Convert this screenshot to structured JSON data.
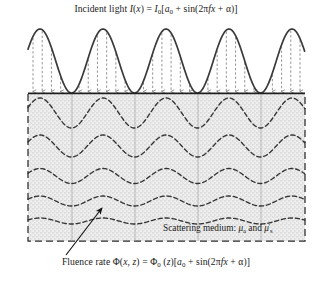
{
  "figure": {
    "title": "Incident light I(x) = I0[a0 + sin(2πfx + α)]",
    "caption": "Fluence rate Φ(x, z) = Φ0 (z)[a0 + sin(2πfx + α)]",
    "medium_label": "Scattering medium: μa and μ's",
    "title_parts": {
      "lead": "Incident light ",
      "i_var": "I",
      "open_x": "(",
      "x_var": "x",
      "close_x": ")",
      "equals": " = ",
      "i0_var": "I",
      "i0_sub": "0",
      "bracket_open": "[",
      "a_var": "a",
      "a_sub": "0",
      "plus": " + sin(2",
      "pi": "π",
      "f_var": "f",
      "x2_var": "x",
      "plus2": " + ",
      "alpha": "α",
      "tail": ")]"
    },
    "caption_parts": {
      "lead": "Fluence rate ",
      "phi": "Φ",
      "open": "(",
      "x_var": "x",
      "comma": ", ",
      "z_var": "z",
      "close": ")",
      "equals": " = ",
      "phi0": "Φ",
      "phi0_sub": "0",
      "z_paren": " (",
      "z_var2": "z",
      "z_close": ")",
      "bracket_open": "[",
      "a_var": "a",
      "a_sub": "0",
      "plus": " + sin(2",
      "pi": "π",
      "f_var": "f",
      "x2_var": "x",
      "plus2": " + ",
      "alpha": "α",
      "tail": ")]"
    },
    "medium_parts": {
      "lead": "Scattering medium: ",
      "mu_a": "μ",
      "mu_a_sub": "a",
      "and": " and ",
      "mu_s": "μ",
      "mu_s_prime": "'",
      "mu_s_sub": "s"
    },
    "colors": {
      "wave_stroke": "#3a3a3a",
      "arrow_stroke": "#8a8a8a",
      "box_border": "#2b2b2b",
      "box_fill": "#ededed",
      "contour_stroke": "#333333",
      "gridline": "#9a9a9a",
      "leader_stroke": "#111111",
      "text": "#1a1a1a"
    }
  },
  "chart_data": {
    "type": "line",
    "title": "Incident light I(x) = I0[a0 + sin(2πfx + α)]",
    "xlabel": "x",
    "ylabel": "Fluence rate / Intensity",
    "grid": false,
    "legend": false,
    "annotations": [
      "Scattering medium: μa and μ's",
      "Fluence rate Φ(x, z) = Φ0 (z)[a0 + sin(2πfx + α)]"
    ],
    "geometry": {
      "plot_left": 28,
      "plot_right": 305,
      "baseline_y": 93,
      "wave_top_y": 28,
      "box_top_y": 94,
      "box_bottom_y": 241,
      "spatial_period_px": 63,
      "peak_x_positions": [
        40,
        103,
        166,
        229,
        292
      ],
      "arrow_count": 30
    },
    "series": [
      {
        "name": "incident light I(x)",
        "kind": "sinusoid",
        "amplitude_px": 32,
        "offset_px": 32,
        "period_px": 63,
        "phase_peak_x": 40,
        "stroke": "#3a3a3a"
      },
      {
        "name": "fluence contour z1",
        "kind": "sinusoid",
        "depth_y": 113,
        "amplitude_px": 15.0,
        "period_px": 63,
        "phase_peak_x": 40,
        "dashed": true
      },
      {
        "name": "fluence contour z2",
        "kind": "sinusoid",
        "depth_y": 146,
        "amplitude_px": 11.0,
        "period_px": 63,
        "phase_peak_x": 40,
        "dashed": true
      },
      {
        "name": "fluence contour z3",
        "kind": "sinusoid",
        "depth_y": 176,
        "amplitude_px": 7.5,
        "period_px": 63,
        "phase_peak_x": 40,
        "dashed": true
      },
      {
        "name": "fluence contour z4",
        "kind": "sinusoid",
        "depth_y": 201,
        "amplitude_px": 5.0,
        "period_px": 63,
        "phase_peak_x": 40,
        "dashed": true
      },
      {
        "name": "fluence contour z5",
        "kind": "sinusoid",
        "depth_y": 221,
        "amplitude_px": 3.0,
        "period_px": 63,
        "phase_peak_x": 40,
        "dashed": true
      }
    ],
    "gridlines_x": [
      72,
      135,
      198,
      261
    ]
  }
}
